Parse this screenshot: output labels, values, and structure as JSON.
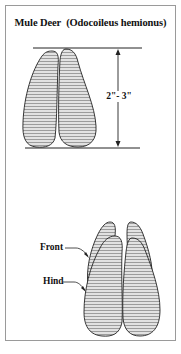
{
  "title": {
    "common_name": "Mule Deer",
    "scientific_name": "(Odocoileus hemionus)"
  },
  "measurement": {
    "label": "2\"- 3\""
  },
  "labels": {
    "front": "Front",
    "hind": "Hind"
  },
  "colors": {
    "ink": "#222222",
    "hatch": "#8a8a8a",
    "fill": "#d9d9d9",
    "frame": "#9a9a9a"
  }
}
